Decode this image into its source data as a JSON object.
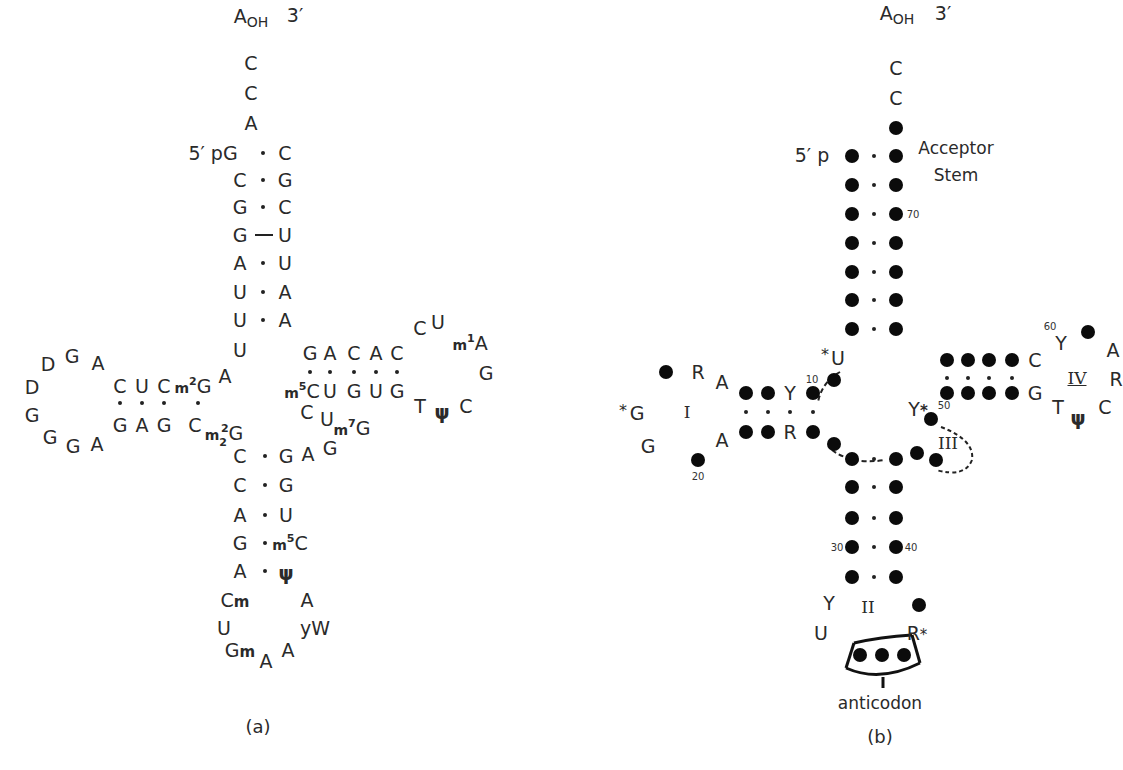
{
  "figure": {
    "panel_a": {
      "caption": "(a)",
      "three_prime_end": {
        "base": "A",
        "subscript": "OH",
        "label": "3′"
      },
      "five_prime_end": "5′ pG",
      "acceptor_overhang": [
        "C",
        "C",
        "A"
      ],
      "acceptor_stem": {
        "left": [
          "G",
          "C",
          "G",
          "G",
          "A",
          "U",
          "U"
        ],
        "right": [
          "C",
          "G",
          "C",
          "U",
          "U",
          "A",
          "A"
        ],
        "pair_marks": [
          "·",
          "·",
          "·",
          "—",
          "·",
          "·",
          "·"
        ]
      },
      "junction_U8": "U",
      "junction_A9": "A",
      "d_stem": {
        "top": [
          "C",
          "U",
          "C",
          "m²G"
        ],
        "bottom": [
          "G",
          "A",
          "G",
          "C"
        ]
      },
      "d_loop": [
        "A",
        "G",
        "D",
        "D",
        "G",
        "G",
        "G",
        "A"
      ],
      "m22G": "m²₂G",
      "anticodon_stem": {
        "left": [
          "C",
          "C",
          "A",
          "G",
          "A"
        ],
        "right": [
          "G",
          "G",
          "U",
          "m⁵C",
          "ψ"
        ]
      },
      "anticodon_loop": [
        "Cm",
        "U",
        "Gm",
        "A",
        "A",
        "yW",
        "A"
      ],
      "variable_loop": [
        "A",
        "G",
        "m⁷G",
        "U",
        "C"
      ],
      "t_stem": {
        "top": [
          "G",
          "A",
          "C",
          "A",
          "C"
        ],
        "bottom": [
          "m⁵C",
          "U",
          "G",
          "U",
          "G"
        ]
      },
      "t_loop": [
        "C",
        "U",
        "m¹A",
        "G",
        "C",
        "ψ",
        "T"
      ]
    },
    "panel_b": {
      "caption": "(b)",
      "three_prime_end": {
        "base": "A",
        "subscript": "OH",
        "label": "3′"
      },
      "five_prime_end": "5′ p",
      "acceptor_overhang": [
        "C",
        "C"
      ],
      "acceptor_label": [
        "Acceptor",
        "Stem"
      ],
      "numbers": {
        "n10": "10",
        "n20": "20",
        "n30": "30",
        "n40": "40",
        "n50": "50",
        "n60": "60",
        "n70": "70"
      },
      "u8": "U",
      "star": "*",
      "d_arm": {
        "roman": "I",
        "bases": {
          "Y": "Y",
          "R_stem": "R",
          "A_top": "A",
          "R_loop": "R",
          "G_star": "G",
          "G_low": "G",
          "A_bottom": "A"
        }
      },
      "anticodon_arm": {
        "roman": "II",
        "Y": "Y",
        "U": "U",
        "R_star": "R",
        "label": "anticodon"
      },
      "variable_arm": {
        "roman": "III",
        "Y_star": "Y"
      },
      "t_arm": {
        "roman": "IV",
        "C": "C",
        "G": "G",
        "Y": "Y",
        "A": "A",
        "R": "R",
        "C_loop": "C",
        "psi": "ψ",
        "T": "T"
      }
    }
  }
}
